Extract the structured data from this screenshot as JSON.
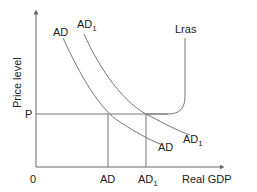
{
  "diagram": {
    "type": "economics-ad-lras",
    "y_axis_label": "Price level",
    "x_axis_label": "Real GDP",
    "origin_label": "0",
    "price_label": "P",
    "curves": {
      "ad": {
        "label": "AD",
        "label_end": "AD"
      },
      "ad1": {
        "label": "AD",
        "sub": "1",
        "label_end": "AD",
        "sub_end": "1"
      },
      "lras": {
        "label": "Lras"
      }
    },
    "x_ticks": {
      "ad": {
        "label": "AD"
      },
      "ad1": {
        "label": "AD",
        "sub": "1"
      }
    },
    "colors": {
      "line": "#666666",
      "text": "#222222"
    }
  }
}
